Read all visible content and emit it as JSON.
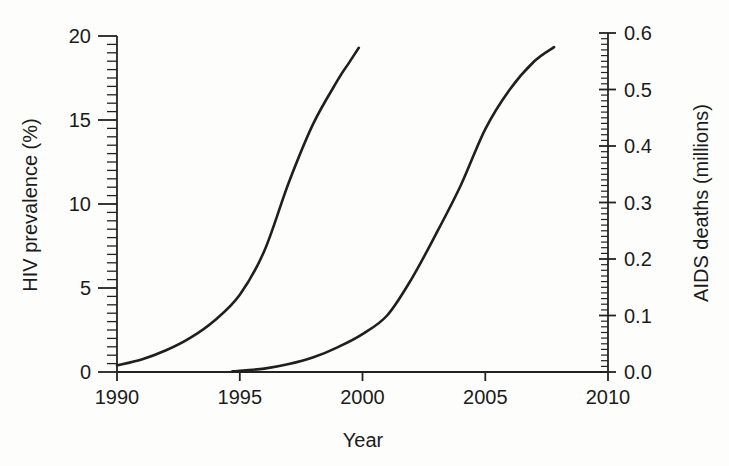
{
  "chart_data": {
    "type": "line",
    "title": "",
    "xlabel": "Year",
    "grid": false,
    "legend": "none",
    "colors": {
      "line": "#1f1f1f",
      "axis": "#222222",
      "text": "#1b1b1b",
      "background": "#fdfdfc"
    },
    "x_axis": {
      "min": 1990,
      "max": 2010,
      "major_step": 5,
      "tick_labels": [
        "1990",
        "1995",
        "2000",
        "2005",
        "2010"
      ]
    },
    "left_axis": {
      "label": "HIV prevalence (%)",
      "min": 0,
      "max": 20,
      "major_step": 5,
      "minor_step": 0.5,
      "tick_labels": [
        "0",
        "5",
        "10",
        "15",
        "20"
      ]
    },
    "right_axis": {
      "label": "AIDS deaths (millions)",
      "min": 0,
      "max": 0.6,
      "major_step": 0.1,
      "minor_step": 0.01,
      "tick_labels": [
        "0.0",
        "0.1",
        "0.2",
        "0.3",
        "0.4",
        "0.5",
        "0.6"
      ]
    },
    "series": [
      {
        "name": "HIV prevalence",
        "axis": "left",
        "points": [
          [
            1990,
            0.4
          ],
          [
            1991,
            0.75
          ],
          [
            1992,
            1.3
          ],
          [
            1993,
            2.05
          ],
          [
            1994,
            3.1
          ],
          [
            1995,
            4.6
          ],
          [
            1996,
            7.2
          ],
          [
            1997,
            11.3
          ],
          [
            1998,
            14.8
          ],
          [
            1999,
            17.4
          ],
          [
            1999.4,
            18.3
          ],
          [
            1999.85,
            19.3
          ]
        ]
      },
      {
        "name": "AIDS deaths",
        "axis": "right",
        "points": [
          [
            1994.7,
            0.001
          ],
          [
            1996,
            0.006
          ],
          [
            1997,
            0.014
          ],
          [
            1998,
            0.026
          ],
          [
            1999,
            0.044
          ],
          [
            2000,
            0.067
          ],
          [
            2001,
            0.1
          ],
          [
            2002,
            0.165
          ],
          [
            2003,
            0.245
          ],
          [
            2004,
            0.33
          ],
          [
            2005,
            0.43
          ],
          [
            2006,
            0.5
          ],
          [
            2007,
            0.55
          ],
          [
            2007.8,
            0.575
          ]
        ]
      }
    ]
  }
}
